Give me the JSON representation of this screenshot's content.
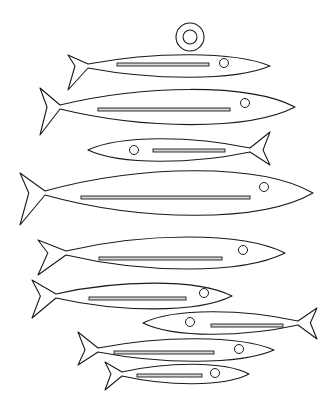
{
  "colors": {
    "stroke": "#1a1a1a",
    "fill": "#ffffff",
    "slot": "#d8d8d8"
  },
  "hanger": {
    "cx": 190,
    "cy": 37,
    "outer_r": 14,
    "inner_r": 7
  },
  "fish": [
    {
      "id": "fish-1",
      "dir": "right",
      "tail_x": 68,
      "tail_top": 55,
      "tail_bot": 90,
      "join_x": 88,
      "nose_x": 270,
      "cy": 66,
      "half_h": 14,
      "eye": [
        224,
        63,
        4.5
      ],
      "slot": [
        117,
        63,
        92,
        3
      ]
    },
    {
      "id": "fish-2",
      "dir": "right",
      "tail_x": 40,
      "tail_top": 88,
      "tail_bot": 135,
      "join_x": 60,
      "nose_x": 295,
      "cy": 107,
      "half_h": 22,
      "eye": [
        245,
        103,
        4.5
      ],
      "slot": [
        98,
        108,
        132,
        3
      ]
    },
    {
      "id": "fish-3",
      "dir": "left",
      "tail_x": 270,
      "tail_top": 132,
      "tail_bot": 165,
      "join_x": 250,
      "nose_x": 88,
      "cy": 150,
      "half_h": 14,
      "eye": [
        134,
        150,
        4.5
      ],
      "slot": [
        153,
        149,
        72,
        3
      ]
    },
    {
      "id": "fish-4",
      "dir": "right",
      "tail_x": 20,
      "tail_top": 173,
      "tail_bot": 225,
      "join_x": 45,
      "nose_x": 313,
      "cy": 193,
      "half_h": 28,
      "eye": [
        264,
        187,
        4.5
      ],
      "slot": [
        81,
        196,
        169,
        3
      ]
    },
    {
      "id": "fish-5",
      "dir": "right",
      "tail_x": 38,
      "tail_top": 240,
      "tail_bot": 275,
      "join_x": 66,
      "nose_x": 285,
      "cy": 253,
      "half_h": 20,
      "eye": [
        243,
        250,
        4.5
      ],
      "slot": [
        99,
        257,
        123,
        3
      ]
    },
    {
      "id": "fish-6",
      "dir": "right",
      "tail_x": 32,
      "tail_top": 280,
      "tail_bot": 318,
      "join_x": 56,
      "nose_x": 232,
      "cy": 296,
      "half_h": 16,
      "eye": [
        204,
        293,
        4.5
      ],
      "slot": [
        89,
        297,
        97,
        3
      ]
    },
    {
      "id": "fish-7",
      "dir": "left",
      "tail_x": 317,
      "tail_top": 308,
      "tail_bot": 339,
      "join_x": 298,
      "nose_x": 143,
      "cy": 323,
      "half_h": 14,
      "eye": [
        190,
        322,
        4.5
      ],
      "slot": [
        211,
        324,
        72,
        3
      ]
    },
    {
      "id": "fish-8",
      "dir": "right",
      "tail_x": 78,
      "tail_top": 332,
      "tail_bot": 365,
      "join_x": 98,
      "nose_x": 274,
      "cy": 350,
      "half_h": 14,
      "eye": [
        239,
        349,
        4.5
      ],
      "slot": [
        114,
        351,
        100,
        3
      ]
    },
    {
      "id": "fish-9",
      "dir": "right",
      "tail_x": 105,
      "tail_top": 362,
      "tail_bot": 390,
      "join_x": 122,
      "nose_x": 249,
      "cy": 374,
      "half_h": 12,
      "eye": [
        215,
        373,
        4.5
      ],
      "slot": [
        137,
        374,
        65,
        3
      ]
    }
  ]
}
